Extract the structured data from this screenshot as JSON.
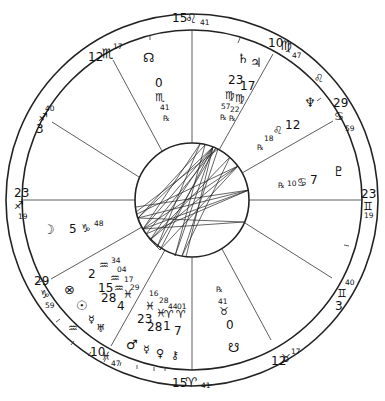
{
  "chart": {
    "type": "natal-wheel",
    "center": [
      192,
      200
    ],
    "radii": {
      "outer": 186,
      "zodiac_inner": 172,
      "aspect_circle": 57
    }
  },
  "cusps": [
    {
      "id": "mc",
      "deg": "15",
      "sign_glyph": "♌",
      "min": "41"
    },
    {
      "id": "c11",
      "deg": "10",
      "sign_glyph": "♍",
      "min": "47"
    },
    {
      "id": "c12",
      "deg": "29",
      "sign_glyph": "♋",
      "min": "59"
    },
    {
      "id": "asc",
      "deg": "23",
      "sign_glyph": "♊",
      "min": "19"
    },
    {
      "id": "c2",
      "deg": "3",
      "sign_glyph": "♊",
      "min": "40"
    },
    {
      "id": "c3",
      "deg": "12",
      "sign_glyph": "♉",
      "min": "17"
    },
    {
      "id": "ic",
      "deg": "15",
      "sign_glyph": "♈",
      "min": "41"
    },
    {
      "id": "c5",
      "deg": "10",
      "sign_glyph": "♓",
      "min": "47"
    },
    {
      "id": "c6",
      "deg": "29",
      "sign_glyph": "♑",
      "min": "59"
    },
    {
      "id": "dsc",
      "deg": "23",
      "sign_glyph": "♐",
      "min": "19"
    },
    {
      "id": "c8",
      "deg": "3",
      "sign_glyph": "♐",
      "min": "40"
    },
    {
      "id": "c9",
      "deg": "12",
      "sign_glyph": "♏",
      "min": "17"
    }
  ],
  "planets": {
    "north_node": {
      "glyph": "☊",
      "deg": "0",
      "sign": "♏",
      "min": "41",
      "retro": "℞"
    },
    "saturn": {
      "glyph": "♄",
      "deg": "23",
      "sign": "♍",
      "min": "57",
      "retro": "℞"
    },
    "jupiter": {
      "glyph": "♃",
      "deg": "17",
      "sign": "♍",
      "min": "22",
      "retro": "℞"
    },
    "neptune": {
      "glyph": "♆",
      "deg": "12",
      "sign": "♌",
      "min": "18",
      "retro": "℞"
    },
    "pluto": {
      "glyph": "♇",
      "deg": "7",
      "sign": "♋",
      "min": "10",
      "retro": "℞"
    },
    "moon": {
      "glyph": "☽",
      "deg": "5",
      "sign": "♑",
      "min": "48"
    },
    "fortune": {
      "glyph": "⊗",
      "deg": "2",
      "sign": "♒",
      "min": "34"
    },
    "sun": {
      "glyph": "☉",
      "deg": "15",
      "sign": "♒",
      "min": "04"
    },
    "mercury": {
      "glyph": "☿",
      "deg": "28",
      "sign": "♒",
      "min": "17"
    },
    "uranus": {
      "glyph": "♅",
      "deg": "4",
      "sign": "♓",
      "min": "29"
    },
    "mars": {
      "glyph": "♂",
      "deg": "23",
      "sign": "♓",
      "min": "16"
    },
    "venus": {
      "glyph": "♀",
      "deg": "28",
      "sign": "♓",
      "min": "28"
    },
    "mercury2": {
      "glyph": "☿",
      "deg": "1",
      "sign": "♈",
      "min": "44"
    },
    "chiron": {
      "glyph": "⚷",
      "deg": "7",
      "sign": "♈",
      "min": "01"
    },
    "south_node": {
      "glyph": "☋",
      "deg": "0",
      "sign": "♉",
      "min": "41",
      "retro": "℞"
    }
  },
  "labels": {
    "leo_marker": "♌",
    "aquarius_marker": "♒",
    "capricorn_cusp_sign": "♑",
    "sag_marker": "♐"
  }
}
